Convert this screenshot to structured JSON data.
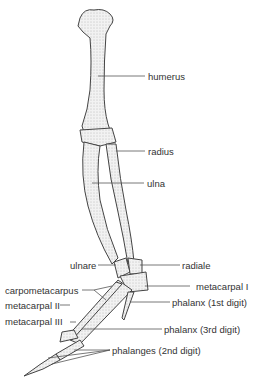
{
  "diagram": {
    "labels": {
      "humerus": "humerus",
      "radius": "radius",
      "ulna": "ulna",
      "ulnare": "ulnare",
      "radiale": "radiale",
      "carpometacarpus": "carpometacarpus",
      "metacarpal_1": "metacarpal I",
      "metacarpal_2": "metacarpal II",
      "metacarpal_3": "metacarpal III",
      "phalanx_1st": "phalanx (1st digit)",
      "phalanx_3rd": "phalanx (3rd digit)",
      "phalanges_2nd": "phalanges (2nd digit)"
    },
    "colors": {
      "bone_fill": "#ececec",
      "bone_stroke": "#444444",
      "leader": "#555555",
      "text": "#333333"
    }
  }
}
